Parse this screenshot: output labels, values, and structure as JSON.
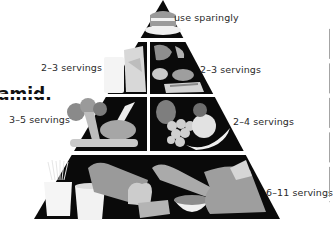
{
  "title_fragment": "amid.",
  "pyramid": {
    "tiers": [
      {
        "name": "fats-oils-sweets",
        "label": "use sparingly"
      },
      {
        "name": "dairy",
        "label": "2–3 servings"
      },
      {
        "name": "protein",
        "label": "2–3 servings"
      },
      {
        "name": "vegetables",
        "label": "3–5 servings"
      },
      {
        "name": "fruits",
        "label": "2–4 servings"
      },
      {
        "name": "grains",
        "label": "6–11 servings"
      }
    ]
  },
  "colors": {
    "background": "#ffffff",
    "pyramid_fill": "#0a0a0a",
    "divider": "#ffffff",
    "food_light": "#e6e6e6",
    "food_mid": "#a8a8a8",
    "food_dark": "#6e6e6e",
    "text": "#2a2a2a"
  }
}
